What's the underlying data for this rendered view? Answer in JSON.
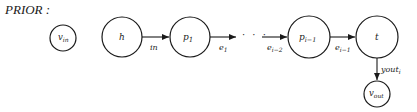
{
  "title": "PRIOR :",
  "nodes": {
    "v_in": {
      "main": "v",
      "sub": "in"
    },
    "h": {
      "main": "h"
    },
    "p1": {
      "main": "p",
      "sub": "1"
    },
    "p_im1": {
      "main": "p",
      "sub": "i−1"
    },
    "t": {
      "main": "t"
    },
    "v_out": {
      "main": "v",
      "sub": "out"
    }
  },
  "edges": {
    "h_p1": {
      "main": "in"
    },
    "p1_dots": {
      "main": "e",
      "sub": "1"
    },
    "dots_pim1": {
      "main": "e",
      "sub": "i−2"
    },
    "pim1_t": {
      "main": "e",
      "sub": "i−1"
    },
    "t_vout": {
      "main": "yout",
      "sub": "i"
    }
  },
  "ellipsis": "· · ·",
  "colors": {
    "stroke": "#1a1a1a",
    "background": "#ffffff"
  }
}
